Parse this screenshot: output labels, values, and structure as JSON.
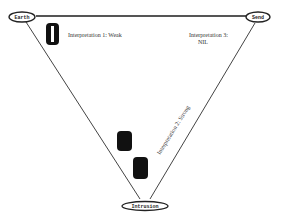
{
  "diagram": {
    "type": "triangle",
    "nodes": [
      {
        "id": "earth",
        "label": "Earth",
        "x": 22,
        "y": 17
      },
      {
        "id": "send",
        "label": "Send",
        "x": 258,
        "y": 17
      },
      {
        "id": "intrusion",
        "label": "Intrusion",
        "x": 145,
        "y": 206
      }
    ],
    "edges": [
      {
        "from": "earth",
        "to": "send",
        "label": "Interpretation 1: Weak"
      },
      {
        "from": "intrusion",
        "to": "send",
        "label": "Interpretation 2: Strong"
      },
      {
        "from": "earth",
        "to": "intrusion",
        "label": ""
      }
    ],
    "annotations": {
      "interp1": "Interpretation 1: Weak",
      "interp2": "Interpretation 2: Strong",
      "interp3_line1": "Interpretation 3:",
      "interp3_line2": "NIL"
    },
    "colors": {
      "line": "#555555",
      "shape": "#111111"
    }
  }
}
